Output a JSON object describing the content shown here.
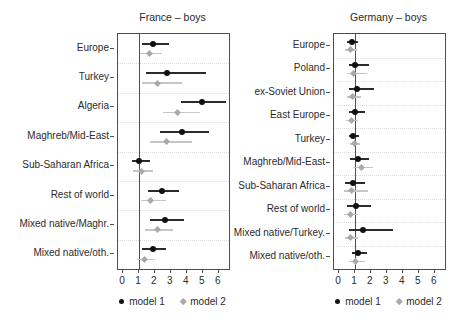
{
  "figure": {
    "background": "#ffffff",
    "axis_color": "#4f4f4f",
    "text_color": "#2b2b2b",
    "gridline_color": "#dcdcdc",
    "model1_color": "#111111",
    "model1_ci_color": "#2b2b2b",
    "model2_color": "#a9a9a9",
    "model2_ci_color": "#c6c6c6"
  },
  "chart_data": [
    {
      "type": "scatter",
      "subtype": "forest-plot",
      "title": "France – boys",
      "xlabel": "",
      "ylabel": "",
      "xticks": [
        0,
        1,
        2,
        3,
        4,
        5,
        6
      ],
      "xlim": [
        -0.31,
        6.63
      ],
      "refline_x": 1,
      "grid": "horizontal-separators",
      "legend_position": "bottom",
      "categories": [
        "Europe",
        "Turkey",
        "Algeria",
        "Maghreb/Mid-East",
        "Sub-Saharan Africa",
        "Rest of world",
        "Mixed native/Maghr.",
        "Mixed native/oth."
      ],
      "series": [
        {
          "name": "model 1",
          "marker": "circle",
          "color": "#111111",
          "values": [
            1.9,
            2.75,
            4.95,
            3.7,
            1.0,
            2.45,
            2.6,
            1.9
          ],
          "ci_low": [
            1.2,
            1.45,
            3.6,
            2.3,
            0.55,
            1.55,
            1.7,
            1.2
          ],
          "ci_high": [
            2.9,
            5.2,
            6.45,
            5.4,
            1.7,
            3.5,
            3.8,
            2.7
          ]
        },
        {
          "name": "model 2",
          "marker": "diamond",
          "color": "#a9a9a9",
          "values": [
            1.65,
            2.15,
            3.4,
            2.7,
            1.15,
            1.75,
            2.15,
            1.35
          ],
          "ci_low": [
            1.05,
            1.2,
            2.5,
            1.7,
            0.65,
            1.1,
            1.4,
            0.9
          ],
          "ci_high": [
            2.45,
            3.7,
            4.8,
            4.3,
            1.9,
            2.7,
            3.1,
            2.0
          ]
        }
      ]
    },
    {
      "type": "scatter",
      "subtype": "forest-plot",
      "title": "Germany – boys",
      "xlabel": "",
      "ylabel": "",
      "xticks": [
        0,
        1,
        2,
        3,
        4,
        5,
        6
      ],
      "xlim": [
        -0.31,
        6.63
      ],
      "refline_x": 1,
      "grid": "horizontal-separators",
      "legend_position": "bottom",
      "categories": [
        "Europe",
        "Poland",
        "ex-Soviet Union",
        "East Europe",
        "Turkey",
        "Maghreb/Mid-East",
        "Sub-Saharan Africa",
        "Rest of world",
        "Mixed native/Turkey.",
        "Mixed native/oth."
      ],
      "series": [
        {
          "name": "model 1",
          "marker": "circle",
          "color": "#111111",
          "values": [
            0.8,
            1.0,
            1.15,
            1.0,
            0.9,
            1.2,
            0.85,
            1.05,
            1.5,
            1.2
          ],
          "ci_low": [
            0.5,
            0.6,
            0.65,
            0.65,
            0.65,
            0.7,
            0.4,
            0.5,
            0.6,
            0.8
          ],
          "ci_high": [
            1.2,
            1.9,
            2.2,
            1.6,
            1.25,
            1.85,
            1.6,
            2.0,
            3.4,
            1.75
          ]
        },
        {
          "name": "model 2",
          "marker": "diamond",
          "color": "#a9a9a9",
          "values": [
            0.7,
            0.9,
            0.85,
            0.75,
            0.95,
            1.4,
            0.8,
            0.7,
            0.7,
            1.0
          ],
          "ci_low": [
            0.4,
            0.5,
            0.5,
            0.45,
            0.7,
            0.85,
            0.3,
            0.3,
            0.4,
            0.6
          ],
          "ci_high": [
            1.1,
            1.75,
            1.4,
            1.2,
            1.3,
            2.1,
            1.8,
            1.2,
            1.2,
            1.6
          ]
        }
      ]
    }
  ]
}
